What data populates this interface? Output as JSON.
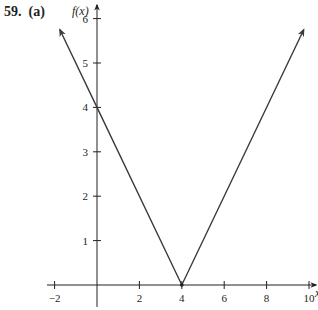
{
  "problem": {
    "number": "59.",
    "part": "(a)"
  },
  "chart_data": {
    "type": "line",
    "title": "",
    "function": "f(x) = |x - 4|",
    "xlabel": "x",
    "ylabel": "f(x)",
    "xlim": [
      -2,
      10
    ],
    "ylim": [
      0,
      6
    ],
    "xticks": [
      -2,
      2,
      4,
      6,
      8,
      10
    ],
    "xtick_labels": [
      "−2",
      "2",
      "4",
      "6",
      "8",
      "10"
    ],
    "yticks": [
      1,
      2,
      3,
      4,
      5,
      6
    ],
    "ytick_labels": [
      "1",
      "2",
      "3",
      "4",
      "5",
      "6"
    ],
    "grid": false,
    "legend": null,
    "series": [
      {
        "name": "f(x)",
        "x": [
          -1.75,
          0,
          4,
          9.75
        ],
        "y": [
          5.75,
          4,
          0,
          5.75
        ],
        "arrows_at_ends": true,
        "color": "#3a3a3a"
      }
    ],
    "points": [
      {
        "x": 4,
        "y": 0,
        "label": "vertex"
      }
    ]
  }
}
